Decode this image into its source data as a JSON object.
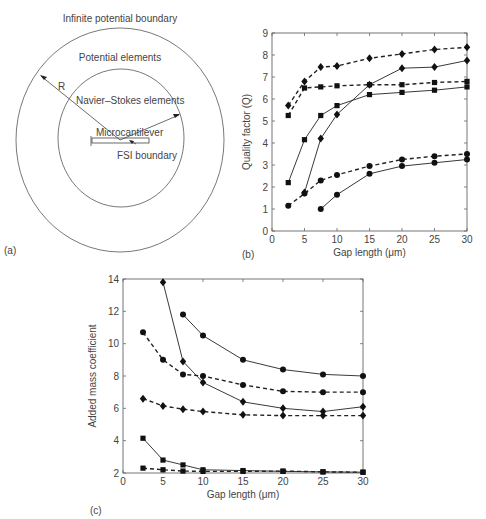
{
  "panel_a": {
    "label": "(a)",
    "outer_boundary": "Infinite potential boundary",
    "outer_region": "Potential elements",
    "inner_region": "Navier–Stokes elements",
    "radius_label": "R",
    "beam": "Microcantilever",
    "interface": "FSI boundary"
  },
  "panel_b": {
    "label": "(b)"
  },
  "panel_c": {
    "label": "(c)"
  },
  "chart_data": [
    {
      "id": "b",
      "type": "line",
      "title": "",
      "xlabel": "Gap length (μm)",
      "ylabel": "Quality factor (Q)",
      "xlim": [
        0,
        30
      ],
      "ylim": [
        0,
        9
      ],
      "xticks": [
        0,
        5,
        10,
        15,
        20,
        25,
        30
      ],
      "yticks": [
        0,
        1,
        2,
        3,
        4,
        5,
        6,
        7,
        8,
        9
      ],
      "grid": false,
      "series": [
        {
          "name": "diamond dashed",
          "marker": "diamond",
          "style": "dashed",
          "x": [
            2.5,
            5,
            7.5,
            10,
            15,
            20,
            25,
            30
          ],
          "y": [
            5.7,
            6.8,
            7.45,
            7.5,
            7.85,
            8.05,
            8.25,
            8.35
          ]
        },
        {
          "name": "diamond solid",
          "marker": "diamond",
          "style": "solid",
          "x": [
            5,
            7.5,
            10,
            15,
            20,
            25,
            30
          ],
          "y": [
            1.75,
            4.2,
            5.3,
            6.65,
            7.4,
            7.45,
            7.75
          ]
        },
        {
          "name": "square dashed",
          "marker": "square",
          "style": "dashed",
          "x": [
            2.5,
            5,
            7.5,
            10,
            15,
            20,
            25,
            30
          ],
          "y": [
            5.25,
            6.5,
            6.55,
            6.6,
            6.65,
            6.65,
            6.75,
            6.8
          ]
        },
        {
          "name": "square solid",
          "marker": "square",
          "style": "solid",
          "x": [
            2.5,
            5,
            7.5,
            10,
            15,
            20,
            25,
            30
          ],
          "y": [
            2.2,
            4.15,
            5.25,
            5.7,
            6.2,
            6.3,
            6.4,
            6.55
          ]
        },
        {
          "name": "circle dashed",
          "marker": "circle",
          "style": "dashed",
          "x": [
            2.5,
            5,
            7.5,
            10,
            15,
            20,
            25,
            30
          ],
          "y": [
            1.15,
            1.7,
            2.3,
            2.55,
            2.95,
            3.25,
            3.4,
            3.5
          ]
        },
        {
          "name": "circle solid",
          "marker": "circle",
          "style": "solid",
          "x": [
            7.5,
            10,
            15,
            20,
            25,
            30
          ],
          "y": [
            1.0,
            1.65,
            2.6,
            2.95,
            3.1,
            3.25
          ]
        }
      ]
    },
    {
      "id": "c",
      "type": "line",
      "title": "",
      "xlabel": "Gap length (μm)",
      "ylabel": "Added mass coefficient",
      "xlim": [
        0,
        30
      ],
      "ylim": [
        2,
        14
      ],
      "xticks": [
        0,
        5,
        10,
        15,
        20,
        25,
        30
      ],
      "yticks": [
        2,
        4,
        6,
        8,
        10,
        12,
        14
      ],
      "grid": false,
      "series": [
        {
          "name": "diamond solid",
          "marker": "diamond",
          "style": "solid",
          "x": [
            5,
            7.5,
            10,
            15,
            20,
            25,
            30
          ],
          "y": [
            13.8,
            8.9,
            7.6,
            6.4,
            6.0,
            5.8,
            6.1
          ]
        },
        {
          "name": "circle solid",
          "marker": "circle",
          "style": "solid",
          "x": [
            7.5,
            10,
            15,
            20,
            25,
            30
          ],
          "y": [
            11.8,
            10.5,
            9.0,
            8.4,
            8.1,
            8.0
          ]
        },
        {
          "name": "circle dashed",
          "marker": "circle",
          "style": "dashed",
          "x": [
            2.5,
            5,
            7.5,
            10,
            15,
            20,
            25,
            30
          ],
          "y": [
            10.7,
            9.0,
            8.1,
            8.0,
            7.45,
            7.05,
            7.0,
            7.0
          ]
        },
        {
          "name": "diamond dashed",
          "marker": "diamond",
          "style": "dashed",
          "x": [
            2.5,
            5,
            7.5,
            10,
            15,
            20,
            25,
            30
          ],
          "y": [
            6.6,
            6.15,
            5.95,
            5.8,
            5.6,
            5.55,
            5.55,
            5.55
          ]
        },
        {
          "name": "square solid",
          "marker": "square",
          "style": "solid",
          "x": [
            2.5,
            5,
            7.5,
            10,
            15,
            20,
            25,
            30
          ],
          "y": [
            4.15,
            2.8,
            2.5,
            2.2,
            2.15,
            2.1,
            2.07,
            2.05
          ]
        },
        {
          "name": "square dashed",
          "marker": "square",
          "style": "dashed",
          "x": [
            2.5,
            5,
            7.5,
            10,
            15,
            20,
            25,
            30
          ],
          "y": [
            2.3,
            2.2,
            2.12,
            2.1,
            2.1,
            2.12,
            2.07,
            2.05
          ]
        }
      ]
    }
  ]
}
